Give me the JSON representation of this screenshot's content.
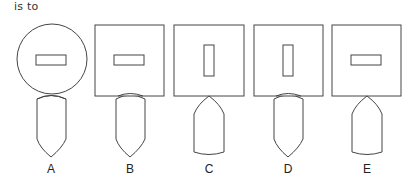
{
  "prompt": "is to",
  "colors": {
    "stroke": "#444444",
    "text": "#222222",
    "background": "#ffffff"
  },
  "options": [
    {
      "label": "A",
      "head_shape": "circle",
      "inner_rect": "horizontal",
      "bullet_direction": "point-down",
      "attachment": "overlapping"
    },
    {
      "label": "B",
      "head_shape": "square",
      "inner_rect": "horizontal",
      "bullet_direction": "point-down",
      "attachment": "overlapping"
    },
    {
      "label": "C",
      "head_shape": "square",
      "inner_rect": "vertical",
      "bullet_direction": "point-up",
      "attachment": "point-touching"
    },
    {
      "label": "D",
      "head_shape": "square",
      "inner_rect": "vertical",
      "bullet_direction": "point-down",
      "attachment": "overlapping"
    },
    {
      "label": "E",
      "head_shape": "square",
      "inner_rect": "horizontal",
      "bullet_direction": "point-up",
      "attachment": "point-touching"
    }
  ]
}
